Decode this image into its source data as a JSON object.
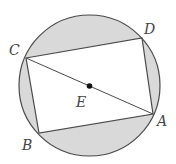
{
  "diagram": {
    "colors": {
      "background": "#ffffff",
      "segment_fill": "#d9d9d9",
      "stroke": "#4a4a4a",
      "center_dot": "#111111",
      "label": "#444444"
    },
    "circle": {
      "cx": 89.5,
      "cy": 85.5,
      "r": 70.5
    },
    "points": {
      "A": {
        "x": 153,
        "y": 114
      },
      "B": {
        "x": 39,
        "y": 133
      },
      "C": {
        "x": 26,
        "y": 58
      },
      "D": {
        "x": 142,
        "y": 38
      },
      "E": {
        "x": 89.5,
        "y": 86
      }
    },
    "labels": {
      "A": {
        "text": "A",
        "x": 157,
        "y": 126
      },
      "B": {
        "text": "B",
        "x": 22,
        "y": 150
      },
      "C": {
        "text": "C",
        "x": 9,
        "y": 55
      },
      "D": {
        "text": "D",
        "x": 144,
        "y": 34
      },
      "E": {
        "text": "E",
        "x": 76,
        "y": 107
      }
    },
    "segments": [
      {
        "from": "C",
        "to": "A",
        "name": "diagonal-CA"
      }
    ]
  }
}
